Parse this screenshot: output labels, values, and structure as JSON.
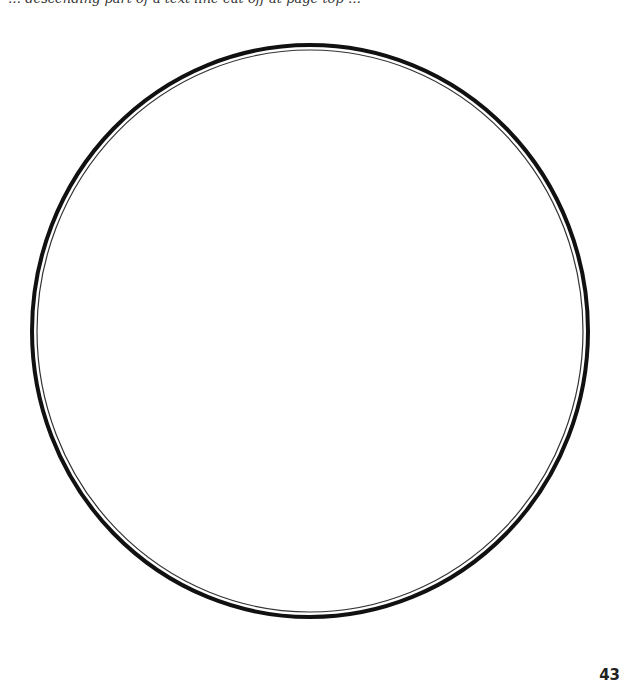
{
  "page": {
    "clipped_header_text": "… descending part of a text line cut off at page top …",
    "page_number": "43"
  },
  "figure": {
    "shape": "circle-outline",
    "center": [
      310,
      331
    ],
    "radius_x": 278,
    "radius_y": 286,
    "outer_stroke_color": "#111111",
    "inner_stroke_color": "#333333",
    "fill": "#ffffff"
  }
}
